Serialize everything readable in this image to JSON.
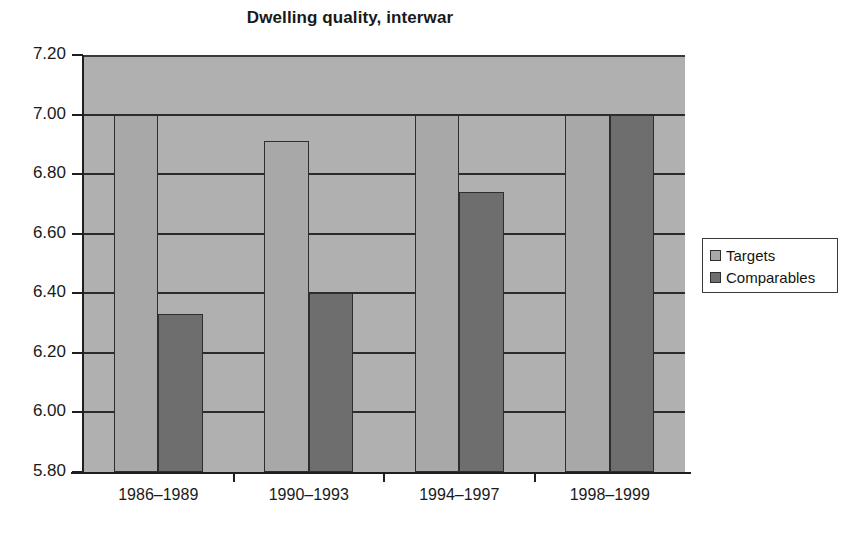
{
  "chart_data": {
    "type": "bar",
    "title": "Dwelling quality, interwar",
    "xlabel": "",
    "ylabel": "",
    "categories": [
      "1986–1989",
      "1990–1993",
      "1994–1997",
      "1998–1999"
    ],
    "series": [
      {
        "name": "Targets",
        "values": [
          7.0,
          6.91,
          7.0,
          7.0
        ],
        "color": "#a8a8a8"
      },
      {
        "name": "Comparables",
        "values": [
          6.33,
          6.4,
          6.74,
          7.0
        ],
        "color": "#6e6e6e"
      }
    ],
    "ylim": [
      5.8,
      7.2
    ],
    "ytick_values": [
      7.2,
      7.0,
      6.8,
      6.6,
      6.4,
      6.2,
      6.0,
      5.8
    ],
    "ytick_labels": [
      "7.20",
      "7.00",
      "6.80",
      "6.60",
      "6.40",
      "6.20",
      "6.00",
      "5.80"
    ],
    "grid": true,
    "grid_axis": "y",
    "legend_position": "right",
    "plot_background": "#b0b0b0"
  },
  "legend": {
    "items": [
      {
        "label": "Targets",
        "swatch": "targets"
      },
      {
        "label": "Comparables",
        "swatch": "comparables"
      }
    ]
  }
}
